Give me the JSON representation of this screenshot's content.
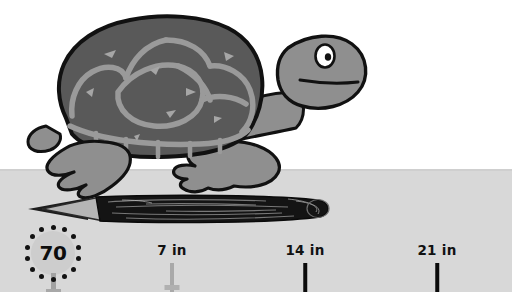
{
  "scene": {
    "title": "Turtle measuring a pencil with an inch ruler",
    "background_top_color": "#ffffff",
    "ground_color": "#d8d8d8",
    "ground_top_y": 169
  },
  "turtle": {
    "name": "turtle",
    "shell_color": "#595959",
    "shell_outline_color": "#111111",
    "scute_line_color": "#9a9a9a",
    "body_color": "#8f8f8f",
    "eye_color": "#ffffff",
    "pupil_color": "#121212",
    "parts": {
      "shell": "shell",
      "head": "head",
      "neck": "neck",
      "eye": "eye",
      "mouth": "mouth",
      "front_leg": "front-leg",
      "rear_leg": "rear-leg",
      "tail": "tail"
    }
  },
  "pencil": {
    "name": "pencil",
    "tip_color": "#1a1a1a",
    "wood_color": "#b5b5b5",
    "body_color": "#141414",
    "length_label": "object being measured"
  },
  "badge": {
    "value": "70",
    "dot_count": 14,
    "circle_color": "#cdcdcd",
    "dot_color": "#121212",
    "post_color": "#a2a2a2"
  },
  "ruler": {
    "unit": "in",
    "ticks": [
      {
        "label": "7 in",
        "x": 172,
        "style": "light"
      },
      {
        "label": "14 in",
        "x": 305,
        "style": "dark"
      },
      {
        "label": "21 in",
        "x": 437,
        "style": "dark"
      }
    ]
  }
}
